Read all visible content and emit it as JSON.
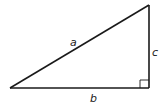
{
  "diagram": {
    "type": "right-triangle",
    "labels": {
      "hypotenuse": "a",
      "base": "b",
      "height": "c"
    },
    "right_angle_marker": true,
    "colors": {
      "stroke": "#1a1a1a",
      "background": "#ffffff"
    }
  }
}
